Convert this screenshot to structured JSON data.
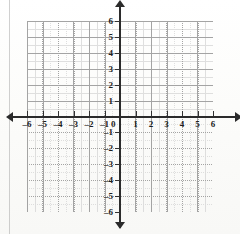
{
  "figure": {
    "kind": "coordinate-plane",
    "axis_color": "#2b2b2b",
    "grid_color": "#9a9a9a",
    "background": "#fdfdfc"
  },
  "axes": {
    "x_name": "x",
    "y_name": "y",
    "origin_label": "0"
  },
  "chart_data": {
    "type": "scatter",
    "title": "",
    "xlabel": "x",
    "ylabel": "y",
    "xlim": [
      -6,
      6
    ],
    "ylim": [
      -6,
      6
    ],
    "grid": true,
    "legend": false,
    "minor_subdivisions": 2,
    "series": [
      {
        "name": "",
        "x": [],
        "y": []
      }
    ],
    "x_ticks": [
      -6,
      -5,
      -4,
      -3,
      -2,
      -1,
      0,
      1,
      2,
      3,
      4,
      5,
      6
    ],
    "y_ticks": [
      -6,
      -5,
      -4,
      -3,
      -2,
      -1,
      0,
      1,
      2,
      3,
      4,
      5,
      6
    ],
    "x_tick_labels": [
      "–6",
      "–5",
      "–4",
      "–3",
      "–2",
      "–1",
      "0",
      "1",
      "2",
      "3",
      "4",
      "5",
      "6"
    ],
    "y_tick_labels": [
      "–6",
      "–5",
      "–4",
      "–3",
      "–2",
      "–1",
      "0",
      "1",
      "2",
      "3",
      "4",
      "5",
      "6"
    ]
  }
}
